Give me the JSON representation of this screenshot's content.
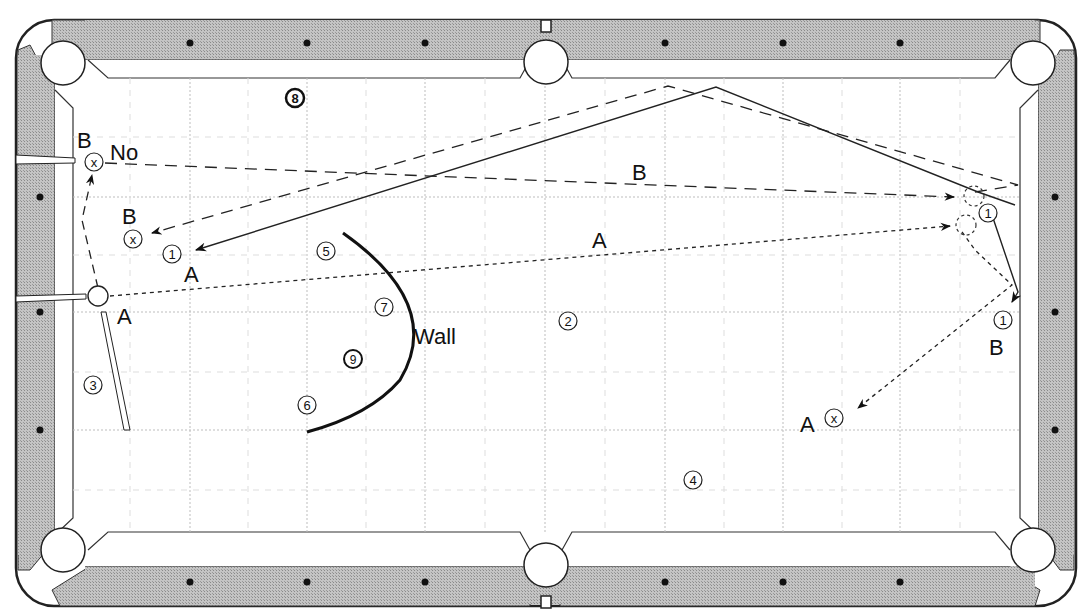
{
  "diagram": {
    "colors": {
      "rail": "#b8b8b8",
      "cloth": "#ffffff",
      "line": "#222222",
      "grid": "#c8c8c8"
    },
    "labels": {
      "no": "No",
      "wall": "Wall",
      "path_a_mid": "A",
      "path_b_mid": "B",
      "cue_a": "A",
      "cue_b": "B",
      "ghost_b_left": "B",
      "object_a_left": "A",
      "object_b_right": "B",
      "target_a_right": "A"
    },
    "balls": [
      {
        "id": "ball-1-left",
        "text": "1"
      },
      {
        "id": "ball-2",
        "text": "2"
      },
      {
        "id": "ball-3",
        "text": "3"
      },
      {
        "id": "ball-4",
        "text": "4"
      },
      {
        "id": "ball-5",
        "text": "5"
      },
      {
        "id": "ball-6",
        "text": "6"
      },
      {
        "id": "ball-7",
        "text": "7"
      },
      {
        "id": "ball-8",
        "text": "8"
      },
      {
        "id": "ball-9",
        "text": "9"
      },
      {
        "id": "ball-1-right-top",
        "text": "1"
      },
      {
        "id": "ball-1-right-bottom",
        "text": "1"
      }
    ],
    "markers": [
      {
        "id": "x-no",
        "text": "x"
      },
      {
        "id": "x-b",
        "text": "x"
      },
      {
        "id": "x-a",
        "text": "x"
      }
    ]
  }
}
